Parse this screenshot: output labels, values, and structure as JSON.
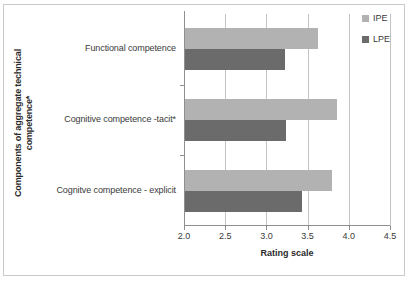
{
  "figure": {
    "top_text_sliver": "",
    "frame_color": "#c9c9c9",
    "background": "#ffffff"
  },
  "chart_data": {
    "type": "bar",
    "orientation": "horizontal",
    "title": "",
    "xlabel": "Rating scale",
    "ylabel": "Components of aggregate technical competence*",
    "ylabel_lines": [
      "Components of aggregate technical",
      "competence*"
    ],
    "categories": [
      "Functional competence",
      "Cognitive competence -tacit*",
      "Cognitve competence - explicit"
    ],
    "series": [
      {
        "name": "IPE",
        "color": "#b2b2b2",
        "values": [
          3.62,
          3.84,
          3.78
        ]
      },
      {
        "name": "LPE",
        "color": "#6b6b6b",
        "values": [
          3.21,
          3.23,
          3.42
        ]
      }
    ],
    "xlim": [
      2.0,
      4.5
    ],
    "xticks": [
      2.0,
      2.5,
      3.0,
      3.5,
      4.0,
      4.5
    ],
    "xtick_labels": [
      "2.0",
      "2.5",
      "3.0",
      "3.5",
      "4.0",
      "4.5"
    ],
    "grid": true,
    "grid_axis": "x",
    "legend_position": "top-right",
    "legend": [
      "IPE",
      "LPE"
    ]
  }
}
